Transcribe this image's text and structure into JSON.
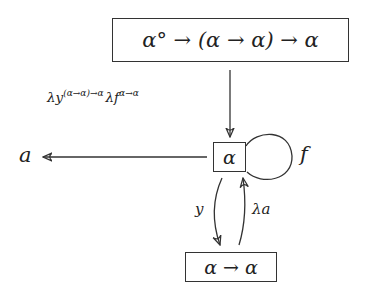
{
  "diagram": {
    "nodes": {
      "top": {
        "label": "α° → (α → α) → α"
      },
      "center": {
        "label": "α"
      },
      "bottom": {
        "label": "α → α"
      },
      "left": {
        "label": "a"
      }
    },
    "edges": {
      "top_to_center": {
        "label": "λy^(α→α)→α λf^α→α",
        "label_main1": "λy",
        "label_sup1": "(α→α)→α",
        "label_main2": "λf",
        "label_sup2": "α→α"
      },
      "center_to_left": {
        "label": ""
      },
      "self_loop": {
        "label": "f"
      },
      "center_to_bottom": {
        "label": "y"
      },
      "bottom_to_center": {
        "label": "λa"
      }
    }
  }
}
